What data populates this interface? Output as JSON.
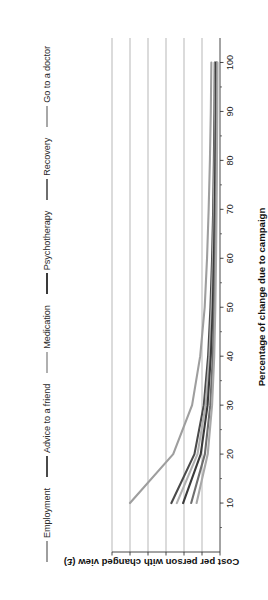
{
  "chart_data": {
    "type": "line",
    "title": "",
    "xlabel": "Percentage of change due to campaign",
    "ylabel": "Cost per person with changed view (£)",
    "xlim": [
      0,
      105
    ],
    "ylim": [
      0,
      60
    ],
    "xticks": [
      10,
      20,
      30,
      40,
      50,
      60,
      70,
      80,
      90,
      100
    ],
    "yticks": [
      0,
      10,
      20,
      30,
      40,
      50,
      60
    ],
    "grid": "horizontal-gridlines-at-each-y-tick",
    "legend_position": "top",
    "x": [
      10,
      20,
      30,
      40,
      50,
      60,
      70,
      80,
      90,
      100
    ],
    "series": [
      {
        "name": "Employment",
        "color": "#9e9e9e",
        "values": [
          50.0,
          26.0,
          15.5,
          11.0,
          8.5,
          7.2,
          6.3,
          5.6,
          5.1,
          4.8
        ]
      },
      {
        "name": "Advice to a friend",
        "color": "#4a4a4a",
        "values": [
          27.0,
          14.2,
          9.0,
          6.6,
          5.3,
          4.4,
          3.8,
          3.4,
          3.1,
          2.9
        ]
      },
      {
        "name": "Medication",
        "color": "#b0b0b0",
        "values": [
          24.0,
          12.5,
          8.0,
          5.9,
          4.7,
          3.9,
          3.4,
          3.0,
          2.7,
          2.5
        ]
      },
      {
        "name": "Psychotherapy",
        "color": "#3a3a3a",
        "values": [
          20.5,
          10.7,
          6.9,
          5.1,
          4.0,
          3.4,
          2.9,
          2.6,
          2.3,
          2.2
        ]
      },
      {
        "name": "Recovery",
        "color": "#6e6e6e",
        "values": [
          16.0,
          8.4,
          5.4,
          4.0,
          3.2,
          2.7,
          2.3,
          2.0,
          1.8,
          1.7
        ]
      },
      {
        "name": "Go to a doctor",
        "color": "#a8a8a8",
        "values": [
          13.0,
          6.8,
          4.4,
          3.2,
          2.6,
          2.2,
          1.9,
          1.7,
          1.5,
          1.4
        ]
      }
    ]
  }
}
